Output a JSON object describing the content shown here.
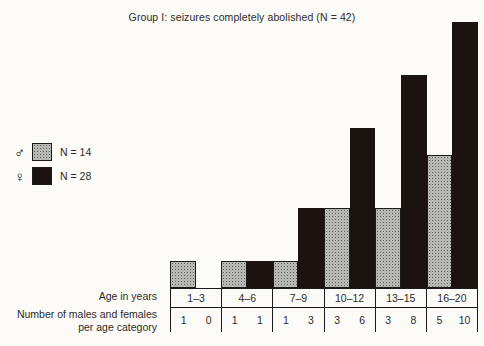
{
  "chart": {
    "title": "Group I: seizures completely abolished (N = 42)"
  },
  "legend": {
    "items": [
      {
        "symbol": "♂",
        "icon": "male-symbol",
        "fill": "stipple",
        "label": "N = 14"
      },
      {
        "symbol": "♀",
        "icon": "female-symbol",
        "fill": "solid-black",
        "label": "N = 28"
      }
    ]
  },
  "table": {
    "age_row_label": "Age in years",
    "counts_row_label_line1": "Number of males and females",
    "counts_row_label_line2": "per age category"
  },
  "colors": {
    "male_fill": "#e9e9e6",
    "male_dot": "#5f5f5c",
    "female_fill": "#1b1310",
    "outline": "#1a1a1a",
    "background": "#fcfbf7"
  },
  "chart_data": {
    "type": "bar",
    "title": "Group I: seizures completely abolished (N = 42)",
    "xlabel": "Age in years",
    "ylabel": "",
    "categories": [
      "1–3",
      "4–6",
      "7–9",
      "10–12",
      "13–15",
      "16–20"
    ],
    "series": [
      {
        "name": "males",
        "symbol": "♂",
        "total": 14,
        "values": [
          1,
          1,
          1,
          3,
          3,
          5
        ]
      },
      {
        "name": "females",
        "symbol": "♀",
        "total": 28,
        "values": [
          0,
          1,
          3,
          6,
          8,
          10
        ]
      }
    ],
    "ylim": [
      0,
      10
    ],
    "grid": false,
    "legend_position": "left",
    "bar_layout": "grouped-adjacent",
    "total_n": 42
  }
}
